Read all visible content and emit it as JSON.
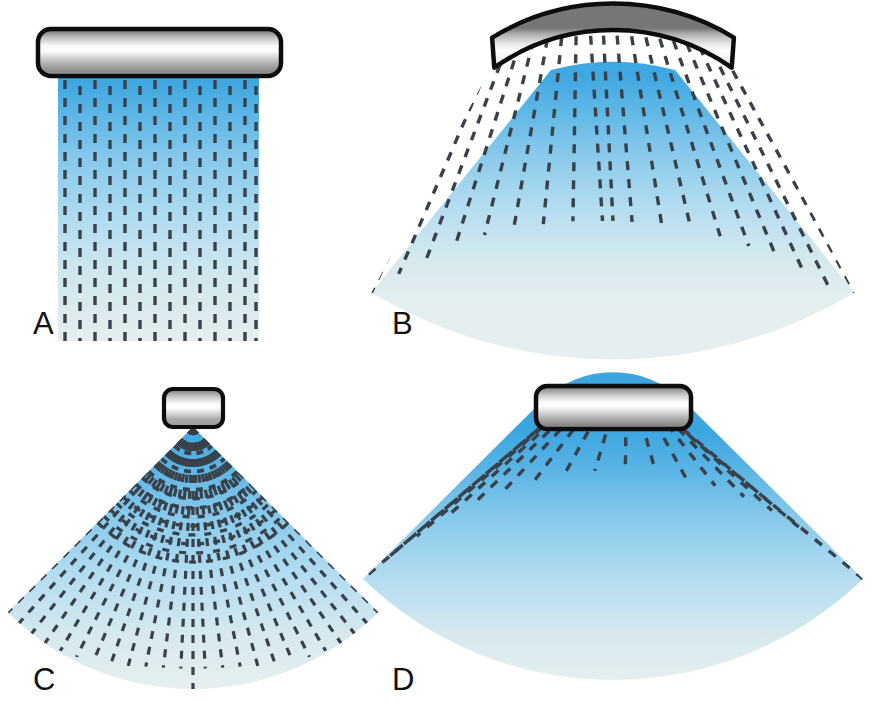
{
  "figure": {
    "background_color": "#ffffff",
    "width": 875,
    "height": 722,
    "panel_count": 4
  },
  "palette": {
    "beam_near_field": "#3BA5E0",
    "beam_mid_field": "#A8D8EE",
    "beam_far_field": "#E2EDEE",
    "scan_line": "#39414B",
    "transducer_outline": "#0D0D0D",
    "transducer_metal_dark": "#6E6E6E",
    "transducer_metal_light": "#FFFFFF",
    "transducer_metal_mid": "#B8B8B8",
    "label_color": "#121212"
  },
  "panels": [
    {
      "id": "A",
      "label": "A",
      "label_x": 33,
      "label_y": 334,
      "transducer_type": "linear-array",
      "transducer_shape": "straight-rounded-bar",
      "beam_shape": "rectangular",
      "scan_line_count": 14,
      "scan_line_orientation": "parallel-vertical",
      "field_geometry": {
        "left": 58,
        "right": 259,
        "top": 78,
        "bottom": 340
      },
      "transducer_geometry": {
        "x": 38,
        "y": 29,
        "width": 243,
        "height": 47,
        "corner_radius": 13
      }
    },
    {
      "id": "B",
      "label": "B",
      "label_x": 392,
      "label_y": 334,
      "transducer_type": "curved-array",
      "transducer_shape": "convex-curved-bar",
      "beam_shape": "trapezoidal-divergent",
      "scan_line_count": 19,
      "scan_line_orientation": "radial-from-virtual-apex",
      "field_geometry": {
        "apex_x": 613,
        "apex_y": -162,
        "top_radius": 240,
        "bottom_radius": 470,
        "half_angle_deg": 31
      },
      "transducer_geometry": {
        "center_x": 613,
        "arc_radius": 232,
        "thickness": 26,
        "half_angle_deg": 15
      }
    },
    {
      "id": "C",
      "label": "C",
      "label_x": 33,
      "label_y": 690,
      "transducer_type": "phased-array",
      "transducer_shape": "small-square",
      "beam_shape": "sector-from-point-apex",
      "scan_line_count": 25,
      "scan_line_orientation": "radial-from-point-apex",
      "field_geometry": {
        "apex_x": 193,
        "apex_y": 427,
        "radius": 262,
        "half_angle_deg": 45
      },
      "transducer_geometry": {
        "x": 164,
        "y": 389,
        "width": 59,
        "height": 38,
        "corner_radius": 9
      }
    },
    {
      "id": "D",
      "label": "D",
      "label_x": 392,
      "label_y": 690,
      "transducer_type": "vector-array",
      "transducer_shape": "straight-rounded-bar",
      "beam_shape": "trapezoidal-divergent",
      "scan_line_count": 17,
      "scan_line_orientation": "radial-from-virtual-apex",
      "field_geometry": {
        "apex_x": 613,
        "apex_y": 330,
        "top_radius": 102,
        "bottom_radius": 360,
        "half_angle_deg": 44
      },
      "transducer_geometry": {
        "x": 536,
        "y": 386,
        "width": 155,
        "height": 43,
        "corner_radius": 11
      }
    }
  ],
  "scan_line_style": {
    "dash_length": 9,
    "dash_gap": 9,
    "stroke_width": 3.4,
    "color": "#39414B"
  }
}
